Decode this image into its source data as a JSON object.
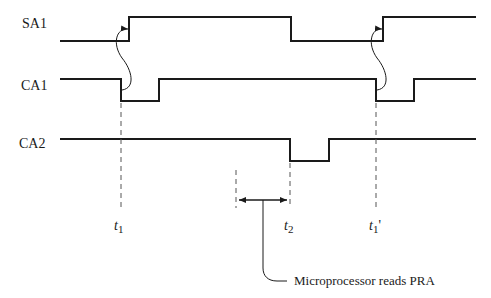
{
  "diagram": {
    "type": "timing-diagram",
    "signals": [
      {
        "name": "SA1",
        "label_x": 22,
        "label_y": 17
      },
      {
        "name": "CA1",
        "label_x": 21,
        "label_y": 79
      },
      {
        "name": "CA2",
        "label_x": 19,
        "label_y": 137
      }
    ],
    "time_markers": [
      {
        "var": "t",
        "sub": "1",
        "prime": ""
      },
      {
        "var": "t",
        "sub": "2",
        "prime": ""
      },
      {
        "var": "t",
        "sub": "1",
        "prime": "'"
      }
    ],
    "annotation": "Microprocessor reads PRA",
    "colors": {
      "line": "#1a1a1a",
      "dash": "#555555",
      "background": "#ffffff"
    }
  }
}
